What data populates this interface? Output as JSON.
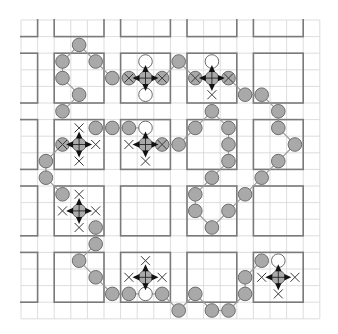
{
  "puzzle": {
    "grid": {
      "cols": 18,
      "rows": 18,
      "origin_x": 21,
      "origin_y": 20,
      "cell": 16.6
    },
    "box_starts": [
      -2,
      2,
      6,
      10,
      14
    ],
    "box_size": 3,
    "colors": {
      "bead": "#a9a9a9",
      "bead_outline": "#6c6c6c",
      "thick_line": "#7a7a7a",
      "thin_line": "#d4d4d4",
      "arrow": "#111111"
    },
    "grey_beads": [
      [
        3,
        1
      ],
      [
        2,
        2
      ],
      [
        4,
        2
      ],
      [
        2,
        3
      ],
      [
        5,
        3
      ],
      [
        9,
        2
      ],
      [
        3,
        4
      ],
      [
        13,
        4
      ],
      [
        14,
        4
      ],
      [
        2,
        5
      ],
      [
        11,
        5
      ],
      [
        15,
        5
      ],
      [
        4,
        6
      ],
      [
        5,
        6
      ],
      [
        6,
        6
      ],
      [
        10,
        6
      ],
      [
        12,
        6
      ],
      [
        15,
        6
      ],
      [
        9,
        7
      ],
      [
        12,
        7
      ],
      [
        16,
        7
      ],
      [
        1,
        8
      ],
      [
        12,
        8
      ],
      [
        15,
        8
      ],
      [
        1,
        9
      ],
      [
        11,
        9
      ],
      [
        14,
        9
      ],
      [
        2,
        10
      ],
      [
        10,
        10
      ],
      [
        13,
        10
      ],
      [
        10,
        11
      ],
      [
        12,
        11
      ],
      [
        4,
        12
      ],
      [
        11,
        12
      ],
      [
        4,
        13
      ],
      [
        3,
        14
      ],
      [
        14,
        14
      ],
      [
        4,
        15
      ],
      [
        13,
        15
      ],
      [
        5,
        16
      ],
      [
        6,
        16
      ],
      [
        8,
        16
      ],
      [
        10,
        16
      ],
      [
        13,
        16
      ],
      [
        9,
        17
      ],
      [
        11,
        17
      ],
      [
        12,
        17
      ]
    ],
    "white_beads": [
      [
        7,
        2
      ],
      [
        7,
        4
      ],
      [
        11,
        2
      ],
      [
        7,
        6
      ],
      [
        7,
        16
      ],
      [
        15,
        14
      ]
    ],
    "x_beads": [
      [
        6,
        3
      ],
      [
        8,
        3
      ],
      [
        10,
        3
      ],
      [
        12,
        3
      ],
      [
        2,
        7
      ],
      [
        8,
        7
      ]
    ],
    "x_marks": [
      [
        11,
        4
      ],
      [
        3,
        6
      ],
      [
        4,
        7
      ],
      [
        3,
        8
      ],
      [
        6,
        7
      ],
      [
        7,
        8
      ],
      [
        3,
        10
      ],
      [
        2,
        11
      ],
      [
        4,
        11
      ],
      [
        3,
        12
      ],
      [
        7,
        14
      ],
      [
        6,
        15
      ],
      [
        8,
        15
      ],
      [
        14,
        15
      ],
      [
        16,
        15
      ],
      [
        15,
        16
      ]
    ],
    "crosshairs": [
      [
        7,
        3
      ],
      [
        11,
        3
      ],
      [
        3,
        7
      ],
      [
        7,
        7
      ],
      [
        3,
        11
      ],
      [
        7,
        15
      ],
      [
        15,
        15
      ]
    ],
    "links": [
      [
        [
          3,
          1
        ],
        [
          2,
          2
        ]
      ],
      [
        [
          3,
          1
        ],
        [
          4,
          2
        ]
      ],
      [
        [
          4,
          2
        ],
        [
          5,
          3
        ]
      ],
      [
        [
          2,
          2
        ],
        [
          2,
          3
        ]
      ],
      [
        [
          2,
          3
        ],
        [
          3,
          4
        ]
      ],
      [
        [
          3,
          4
        ],
        [
          2,
          5
        ]
      ],
      [
        [
          5,
          3
        ],
        [
          6,
          3
        ]
      ],
      [
        [
          8,
          3
        ],
        [
          9,
          2
        ]
      ],
      [
        [
          9,
          2
        ],
        [
          10,
          3
        ]
      ],
      [
        [
          12,
          3
        ],
        [
          13,
          4
        ]
      ],
      [
        [
          13,
          4
        ],
        [
          14,
          4
        ]
      ],
      [
        [
          14,
          4
        ],
        [
          15,
          5
        ]
      ],
      [
        [
          15,
          5
        ],
        [
          15,
          6
        ]
      ],
      [
        [
          15,
          6
        ],
        [
          16,
          7
        ]
      ],
      [
        [
          16,
          7
        ],
        [
          15,
          8
        ]
      ],
      [
        [
          15,
          8
        ],
        [
          14,
          9
        ]
      ],
      [
        [
          14,
          9
        ],
        [
          13,
          10
        ]
      ],
      [
        [
          13,
          10
        ],
        [
          12,
          11
        ]
      ],
      [
        [
          12,
          11
        ],
        [
          11,
          12
        ]
      ],
      [
        [
          11,
          12
        ],
        [
          10,
          11
        ]
      ],
      [
        [
          10,
          11
        ],
        [
          10,
          10
        ]
      ],
      [
        [
          10,
          10
        ],
        [
          11,
          9
        ]
      ],
      [
        [
          11,
          9
        ],
        [
          12,
          8
        ]
      ],
      [
        [
          12,
          8
        ],
        [
          12,
          7
        ]
      ],
      [
        [
          12,
          7
        ],
        [
          12,
          6
        ]
      ],
      [
        [
          12,
          6
        ],
        [
          11,
          5
        ]
      ],
      [
        [
          11,
          5
        ],
        [
          10,
          6
        ]
      ],
      [
        [
          10,
          6
        ],
        [
          9,
          7
        ]
      ],
      [
        [
          9,
          7
        ],
        [
          8,
          7
        ]
      ],
      [
        [
          4,
          6
        ],
        [
          5,
          6
        ]
      ],
      [
        [
          5,
          6
        ],
        [
          6,
          6
        ]
      ],
      [
        [
          6,
          6
        ],
        [
          7,
          6
        ]
      ],
      [
        [
          1,
          8
        ],
        [
          1,
          9
        ]
      ],
      [
        [
          1,
          9
        ],
        [
          2,
          10
        ]
      ],
      [
        [
          1,
          8
        ],
        [
          2,
          7
        ]
      ],
      [
        [
          4,
          12
        ],
        [
          4,
          13
        ]
      ],
      [
        [
          4,
          13
        ],
        [
          3,
          14
        ]
      ],
      [
        [
          3,
          14
        ],
        [
          4,
          15
        ]
      ],
      [
        [
          4,
          15
        ],
        [
          5,
          16
        ]
      ],
      [
        [
          5,
          16
        ],
        [
          6,
          16
        ]
      ],
      [
        [
          6,
          16
        ],
        [
          7,
          16
        ]
      ],
      [
        [
          7,
          16
        ],
        [
          8,
          16
        ]
      ],
      [
        [
          8,
          16
        ],
        [
          9,
          17
        ]
      ],
      [
        [
          9,
          17
        ],
        [
          10,
          16
        ]
      ],
      [
        [
          10,
          16
        ],
        [
          11,
          17
        ]
      ],
      [
        [
          11,
          17
        ],
        [
          12,
          17
        ]
      ],
      [
        [
          12,
          17
        ],
        [
          13,
          16
        ]
      ],
      [
        [
          13,
          16
        ],
        [
          13,
          15
        ]
      ],
      [
        [
          13,
          15
        ],
        [
          14,
          14
        ]
      ]
    ]
  }
}
